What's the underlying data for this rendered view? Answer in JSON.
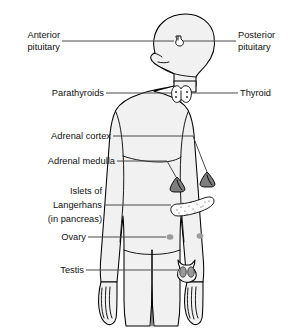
{
  "figure": {
    "view": "anterior with head in profile",
    "background_color": "#ffffff",
    "body_fill_color": "#f1f1f1",
    "outline_color": "#000000",
    "leader_line_color": "#4a4a4a",
    "organ_fill_dark": "#7d7d7d",
    "organ_fill_gray": "#9b9b9b",
    "label_text_color": "#111111"
  },
  "labels": {
    "left": [
      {
        "id": "anterior-pituitary",
        "lines": [
          "Anterior",
          "pituitary"
        ],
        "target": "pituitary-gland"
      },
      {
        "id": "parathyroids",
        "lines": [
          "Parathyroids"
        ],
        "target": "thyroid-gland"
      },
      {
        "id": "adrenal-cortex",
        "lines": [
          "Adrenal cortex"
        ],
        "target": "adrenal-gland-right"
      },
      {
        "id": "adrenal-medulla",
        "lines": [
          "Adrenal medulla"
        ],
        "target": "adrenal-gland-left"
      },
      {
        "id": "islets-of-langerhans",
        "lines": [
          "Islets of",
          "Langerhans",
          "(in pancreas)"
        ],
        "target": "pancreas"
      },
      {
        "id": "ovary",
        "lines": [
          "Ovary"
        ],
        "target": "ovary-left"
      },
      {
        "id": "testis",
        "lines": [
          "Testis"
        ],
        "target": "testes"
      }
    ],
    "right": [
      {
        "id": "posterior-pituitary",
        "lines": [
          "Posterior",
          "pituitary"
        ],
        "target": "pituitary-gland"
      },
      {
        "id": "thyroid",
        "lines": [
          "Thyroid"
        ],
        "target": "thyroid-gland"
      }
    ]
  },
  "organs": [
    {
      "id": "pituitary-gland",
      "name": "pituitary",
      "x": 178,
      "y": 41,
      "fill": "#ffffff"
    },
    {
      "id": "thyroid-gland",
      "name": "thyroid",
      "x": 180,
      "y": 94,
      "fill": "#ffffff"
    },
    {
      "id": "adrenal-gland-left",
      "name": "adrenal-medulla",
      "x": 178,
      "y": 184,
      "fill": "#7d7d7d"
    },
    {
      "id": "adrenal-gland-right",
      "name": "adrenal-cortex",
      "x": 207,
      "y": 180,
      "fill": "#7d7d7d"
    },
    {
      "id": "pancreas",
      "name": "islets-of-langerhans",
      "x": 189,
      "y": 207,
      "fill": "#efefef"
    },
    {
      "id": "ovary-left",
      "name": "ovary",
      "x": 170,
      "y": 237,
      "fill": "#9b9b9b"
    },
    {
      "id": "ovary-right",
      "name": "ovary",
      "x": 200,
      "y": 236,
      "fill": "#9b9b9b"
    },
    {
      "id": "testes",
      "name": "testis",
      "x": 186,
      "y": 271,
      "fill": "#9b9b9b"
    }
  ]
}
